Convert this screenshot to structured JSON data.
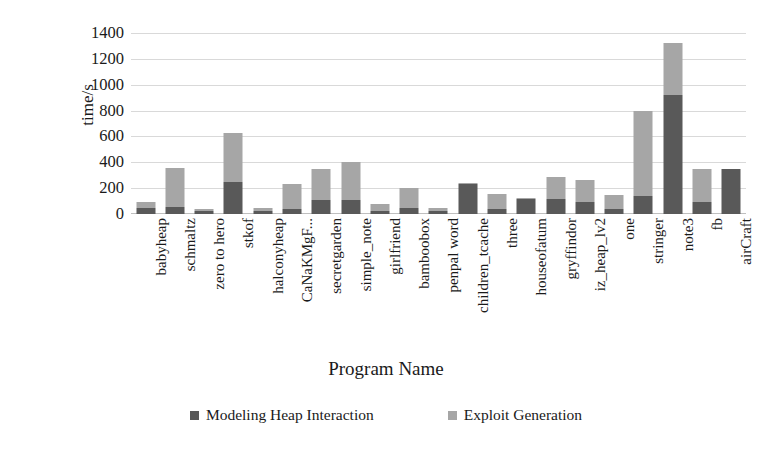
{
  "chart_data": {
    "type": "bar",
    "subtype": "stacked-bar",
    "title": "",
    "xlabel": "Program Name",
    "ylabel": "time/s",
    "ylim": [
      0,
      1400
    ],
    "ytick_step": 200,
    "yticks": [
      "1400",
      "1200",
      "1000",
      "800",
      "600",
      "400",
      "200",
      "0"
    ],
    "grid": true,
    "legend_position": "bottom",
    "categories": [
      "babyheap",
      "schmaltz",
      "zero to hero",
      "stkof",
      "halconyheap",
      "CaNaKMgF...",
      "secretgarden",
      "simple_note",
      "girlfriend",
      "bamboobox",
      "penpal word",
      "children_tcache",
      "three",
      "houseofatum",
      "gryffindor",
      "iz_heap_lv2",
      "one",
      "stringer",
      "note3",
      "fb",
      "airCraft"
    ],
    "series": [
      {
        "name": "Modeling Heap Interaction",
        "color": "#595959",
        "values": [
          50,
          55,
          20,
          245,
          25,
          40,
          110,
          105,
          25,
          45,
          25,
          235,
          40,
          120,
          120,
          95,
          40,
          140,
          920,
          90,
          345
        ]
      },
      {
        "name": "Exploit Generation",
        "color": "#a6a6a6",
        "values": [
          40,
          300,
          15,
          380,
          20,
          195,
          235,
          295,
          50,
          160,
          20,
          5,
          115,
          5,
          165,
          165,
          110,
          655,
          400,
          255,
          0
        ]
      }
    ],
    "totals": [
      90,
      355,
      35,
      625,
      45,
      235,
      345,
      400,
      75,
      205,
      45,
      240,
      155,
      125,
      285,
      260,
      150,
      795,
      1320,
      345,
      345
    ]
  },
  "legend": {
    "items": [
      {
        "label": "Modeling Heap Interaction",
        "color": "#595959",
        "swatch": "square-swatch"
      },
      {
        "label": "Exploit Generation",
        "color": "#a6a6a6",
        "swatch": "square-swatch"
      }
    ]
  }
}
